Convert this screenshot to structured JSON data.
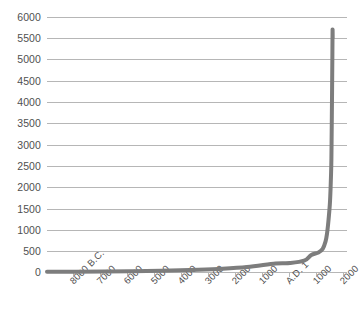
{
  "chart_data": {
    "type": "line",
    "title": "",
    "subtitle": "",
    "xlabel": "",
    "ylabel": "",
    "grid": true,
    "legend": false,
    "legend_position": "none",
    "line_color": "#7d7d7d",
    "grid_color": "#b6b6b6",
    "axis_color": "#b6b6b6",
    "background_color": "#ffffff",
    "text_color": "#4f4f4f",
    "xlim": [
      -8000,
      2500
    ],
    "ylim": [
      0,
      6000
    ],
    "y_ticks": [
      0,
      500,
      1000,
      1500,
      2000,
      2500,
      3000,
      3500,
      4000,
      4500,
      5000,
      5500,
      6000
    ],
    "y_tick_labels": [
      "0",
      "500",
      "1000",
      "1500",
      "2000",
      "2500",
      "3000",
      "3500",
      "4000",
      "4500",
      "5000",
      "5500",
      "6000"
    ],
    "x_ticks": [
      -8000,
      -7000,
      -6000,
      -5000,
      -4000,
      -3000,
      -2000,
      -1000,
      1,
      1000,
      2000
    ],
    "x_tick_labels": [
      "8000 B.C.",
      "7000",
      "6000",
      "5000",
      "4000",
      "3000",
      "2000",
      "1000",
      "A.D. 1",
      "1000",
      "2000"
    ],
    "series": [
      {
        "name": "World population",
        "x": [
          -8000,
          -7000,
          -6000,
          -5000,
          -4000,
          -3000,
          -2000,
          -1000,
          1,
          500,
          1000,
          1250,
          1500,
          1650,
          1750,
          1800,
          1850,
          1900,
          1927,
          1950,
          1960,
          1974,
          1987,
          1990,
          1995,
          1999
        ],
        "values": [
          5,
          8,
          12,
          18,
          28,
          45,
          72,
          115,
          200,
          210,
          265,
          400,
          460,
          545,
          720,
          900,
          1200,
          1600,
          2000,
          2520,
          3020,
          4000,
          5000,
          5270,
          5700,
          5500
        ]
      }
    ]
  }
}
